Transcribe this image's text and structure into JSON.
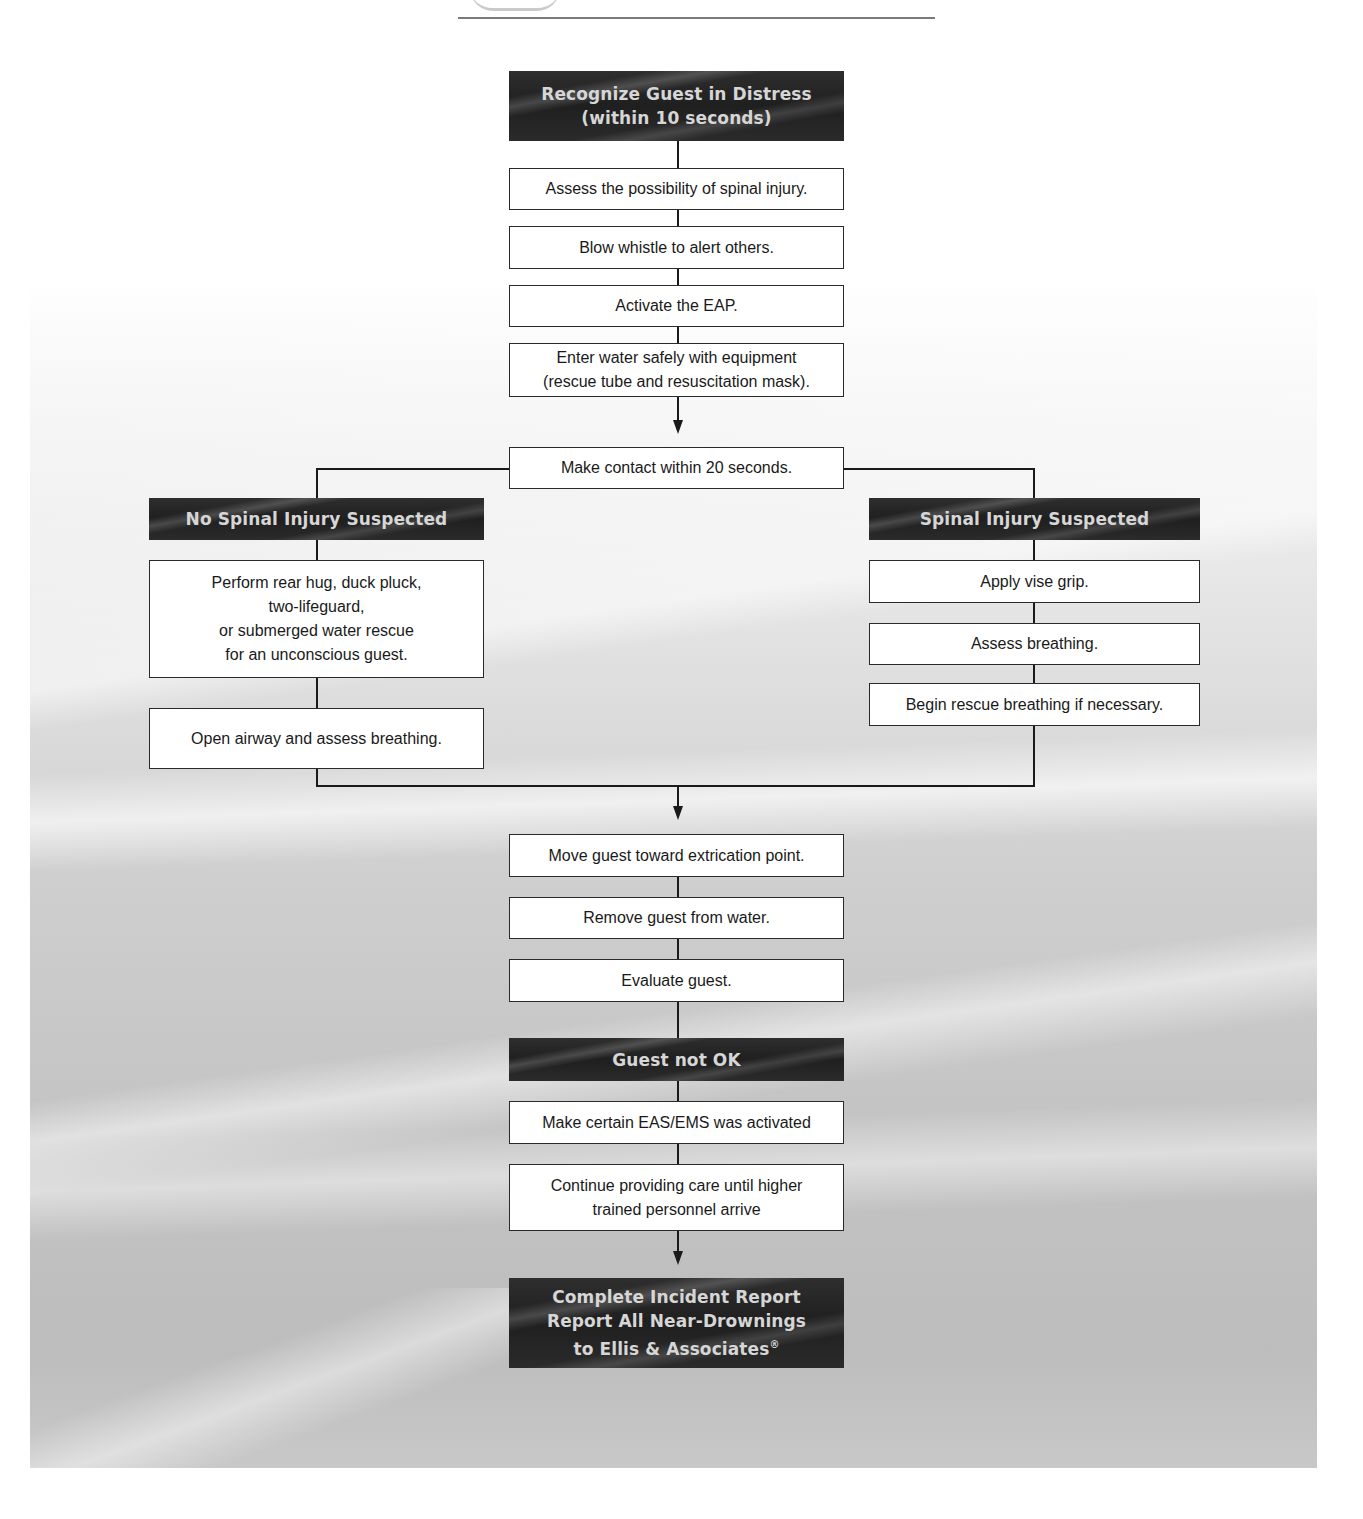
{
  "diagram": {
    "type": "flowchart",
    "start": {
      "label": "Recognize Guest in Distress\n(within 10 seconds)"
    },
    "main_steps": [
      {
        "label": "Assess the possibility of  spinal injury."
      },
      {
        "label": "Blow whistle to alert others."
      },
      {
        "label": "Activate the EAP."
      },
      {
        "label": "Enter water safely with equipment\n(rescue tube and resuscitation mask)."
      },
      {
        "label": "Make contact within 20 seconds."
      }
    ],
    "branches": {
      "left": {
        "header": "No Spinal Injury Suspected",
        "steps": [
          {
            "label": "Perform rear hug, duck pluck,\ntwo-lifeguard,\nor submerged water rescue\nfor an unconscious guest."
          },
          {
            "label": "Open airway and assess breathing."
          }
        ]
      },
      "right": {
        "header": "Spinal Injury Suspected",
        "steps": [
          {
            "label": "Apply vise grip."
          },
          {
            "label": "Assess breathing."
          },
          {
            "label": "Begin rescue breathing if necessary."
          }
        ]
      }
    },
    "merge_steps": [
      {
        "label": "Move guest toward extrication point."
      },
      {
        "label": "Remove guest from water."
      },
      {
        "label": "Evaluate guest."
      }
    ],
    "condition": {
      "label": "Guest not OK"
    },
    "post_condition_steps": [
      {
        "label": "Make certain EAS/EMS was activated"
      },
      {
        "label": "Continue providing care until higher\ntrained personnel arrive"
      }
    ],
    "end": {
      "label": "Complete Incident Report\nReport  All Near-Drownings\nto Ellis & Associates",
      "mark": "®"
    },
    "colors": {
      "dark_box": "#222222",
      "dark_text": "#d6d6d6",
      "box_border": "#2a2a2a",
      "connector": "#1a1a1a"
    }
  }
}
